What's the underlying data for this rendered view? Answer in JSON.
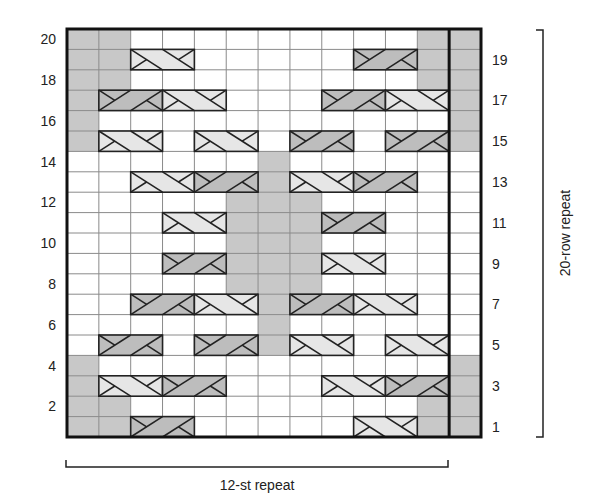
{
  "chart": {
    "stitch_repeat_label": "12-st repeat",
    "row_repeat_label": "20-row repeat",
    "columns": 13,
    "rows": 20,
    "left_row_numbers": [
      20,
      18,
      16,
      14,
      12,
      10,
      8,
      6,
      4,
      2
    ],
    "right_row_numbers": [
      19,
      17,
      15,
      13,
      11,
      9,
      7,
      5,
      3,
      1
    ],
    "legend_key": {
      "W": "white stitch",
      "G": "gray (shaded) stitch",
      "L": "light cable, left-leaning, 2 sts",
      "D": "dark cable, right-leaning, 2 sts",
      "-": "continuation of cable"
    },
    "colors": {
      "white": "#ffffff",
      "gray": "#c8c8c8",
      "cable_light": "#e6e6e6",
      "cable_dark": "#bdbdbd",
      "grid_line": "#8a8a8a",
      "border": "#111111"
    },
    "grid_rows_top_to_bottom": [
      {
        "row": 20,
        "cells": "GGWWWWWWWWWGG"
      },
      {
        "row": 19,
        "cells": "GGL-WWWWWD-GG"
      },
      {
        "row": 18,
        "cells": "GGWWWWWWWWWGG"
      },
      {
        "row": 17,
        "cells": "GD-L-WWWD-L-G"
      },
      {
        "row": 16,
        "cells": "GWWWWWWWWWWWG"
      },
      {
        "row": 15,
        "cells": "GL-WL-WD-WD-G"
      },
      {
        "row": 14,
        "cells": "WWWWWWGWWWWWW"
      },
      {
        "row": 13,
        "cells": "WWL-D-GL-D-WW"
      },
      {
        "row": 12,
        "cells": "WWWWWGGGWWWWW"
      },
      {
        "row": 11,
        "cells": "WWWL-GGGD-WWW"
      },
      {
        "row": 10,
        "cells": "WWWWWGGGWWWWW"
      },
      {
        "row": 9,
        "cells": "WWWD-GGGL-WWW"
      },
      {
        "row": 8,
        "cells": "WWWWWGGGWWWWW"
      },
      {
        "row": 7,
        "cells": "WWD-L-GD-L-WW"
      },
      {
        "row": 6,
        "cells": "WWWWWWGWWWWWW"
      },
      {
        "row": 5,
        "cells": "WD-WD-GL-WL-W"
      },
      {
        "row": 4,
        "cells": "GWWWWWWWWWWWG"
      },
      {
        "row": 3,
        "cells": "GL-D-WWWL-D-G"
      },
      {
        "row": 2,
        "cells": "GGWWWWWWWWWGG"
      },
      {
        "row": 1,
        "cells": "GGD-WWWWWL-GG"
      }
    ]
  }
}
